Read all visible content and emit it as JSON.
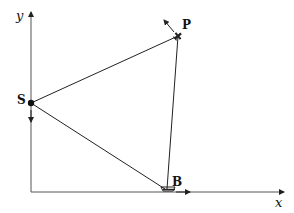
{
  "diagram": {
    "axes": {
      "x_label": "x",
      "y_label": "y"
    },
    "points": [
      {
        "id": "S",
        "label": "S"
      },
      {
        "id": "P",
        "label": "P"
      },
      {
        "id": "B",
        "label": "B"
      }
    ],
    "segments": [
      {
        "from": "S",
        "to": "P"
      },
      {
        "from": "S",
        "to": "B"
      },
      {
        "from": "B",
        "to": "P"
      }
    ],
    "arrows": [
      {
        "at": "P",
        "direction": "up-left"
      },
      {
        "at": "S",
        "direction": "down along y-axis"
      },
      {
        "at": "B",
        "direction": "right along x-axis"
      }
    ],
    "colors": {
      "line": "#222222",
      "background": "#ffffff"
    }
  }
}
